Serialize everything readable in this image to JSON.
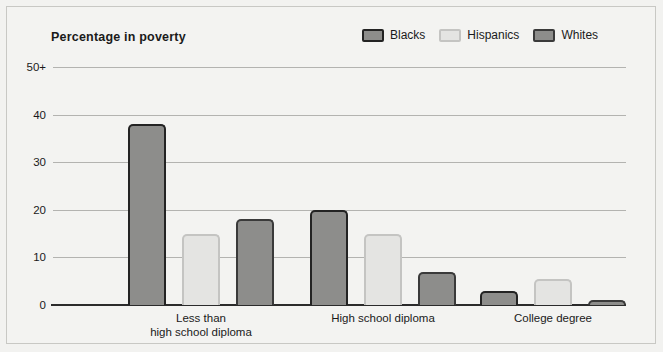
{
  "chart_data": {
    "type": "bar",
    "title": "Percentage in poverty",
    "xlabel": "",
    "ylabel": "",
    "ylim": [
      0,
      50
    ],
    "yticks": [
      "0",
      "10",
      "20",
      "30",
      "40",
      "50+"
    ],
    "ytick_values": [
      0,
      10,
      20,
      30,
      40,
      50
    ],
    "grid": true,
    "legend_position": "top-right",
    "categories": [
      "Less than\nhigh school diploma",
      "High school diploma",
      "College degree"
    ],
    "series": [
      {
        "name": "Blacks",
        "color": "#8d8d8b",
        "border_color": "#232323",
        "values": [
          38,
          20,
          3
        ]
      },
      {
        "name": "Hispanics",
        "color": "#e4e4e2",
        "border_color": "#c4c4c2",
        "values": [
          15,
          15,
          5.5
        ]
      },
      {
        "name": "Whites",
        "color": "#8d8d8b",
        "border_color": "#3a3a3a",
        "values": [
          18,
          7,
          1
        ]
      }
    ]
  },
  "panel": {
    "background": "#f3f3f1",
    "border_color": "#c8c8c4"
  }
}
